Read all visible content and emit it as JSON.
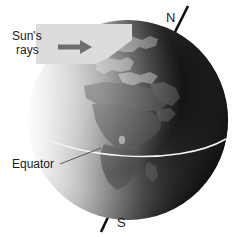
{
  "figure": {
    "background_color": "#ffffff",
    "width": 243,
    "height": 237
  },
  "labels": {
    "north_pole": "N",
    "south_pole": "S",
    "equator": "Equator",
    "sun_rays_line1": "Sun's",
    "sun_rays_line2": "rays"
  },
  "colors": {
    "text": "#1a1a1a",
    "axis_line": "#111111",
    "leader_line": "#4a4a4a",
    "equator_line": "#f2f2f2",
    "ray_band": "#dcdcdc",
    "arrow": "#6e6e6e",
    "globe_lit": "#e9e9e9",
    "globe_dark": "#050505",
    "ocean_mid": "#8a8a8a",
    "land_light": "#f0f0f0",
    "land_mid": "#6a6a6a"
  },
  "globe": {
    "center_x": 128,
    "center_y": 120,
    "radius": 100,
    "axis_tilt_degrees": 23.5,
    "terminator_note": "day side on the left, night side on the right",
    "equator_label_leader": "line from Equator text to the equator curve"
  },
  "icons": {
    "sun_ray_arrow": "arrow-right-icon",
    "axis": "rotation-axis-line"
  }
}
